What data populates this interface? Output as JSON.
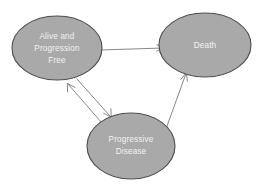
{
  "diagram": {
    "background_color": "#ffffff",
    "node_fill_color": "#a9a9a9",
    "node_stroke_color": "#4d4d4d",
    "node_text_color": "#f2f2f2",
    "edge_color": "#7a7a7a",
    "nodes": [
      {
        "id": "alive-progression-free",
        "label_lines": [
          "Alive and",
          "Progression",
          "Free"
        ],
        "line1": "Alive and",
        "line2": "Progression",
        "line3": "Free",
        "cx": 57,
        "cy": 48,
        "rx": 45,
        "ry": 32
      },
      {
        "id": "death",
        "label_lines": [
          "Death"
        ],
        "line1": "Death",
        "cx": 205,
        "cy": 45,
        "rx": 46,
        "ry": 32
      },
      {
        "id": "progressive-disease",
        "label_lines": [
          "Progressive",
          "Disease"
        ],
        "line1": "Progressive",
        "line2": "Disease",
        "cx": 131,
        "cy": 146,
        "rx": 44,
        "ry": 33
      }
    ],
    "edges": [
      {
        "id": "alive-to-death",
        "from": "alive-progression-free",
        "to": "death",
        "label": "",
        "direction": "one-way"
      },
      {
        "id": "alive-to-progressive",
        "from": "alive-progression-free",
        "to": "progressive-disease",
        "label": "",
        "direction": "one-way"
      },
      {
        "id": "progressive-to-alive",
        "from": "progressive-disease",
        "to": "alive-progression-free",
        "label": "",
        "direction": "one-way"
      },
      {
        "id": "progressive-to-death",
        "from": "progressive-disease",
        "to": "death",
        "label": "",
        "direction": "one-way"
      }
    ]
  }
}
